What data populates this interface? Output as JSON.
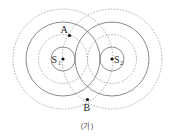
{
  "figure": {
    "caption": "(가)",
    "sources": [
      {
        "id": "S1",
        "label": "S",
        "subscript": "1"
      },
      {
        "id": "S2",
        "label": "S",
        "subscript": "2"
      }
    ],
    "points": [
      {
        "id": "A",
        "label": "A"
      },
      {
        "id": "B",
        "label": "B"
      }
    ],
    "legend": {
      "solid": "crest",
      "dashed": "trough"
    },
    "colors": {
      "solid_line": "#6e6e6e",
      "dashed_line": "#9a9a9a",
      "points": "#111111"
    }
  }
}
